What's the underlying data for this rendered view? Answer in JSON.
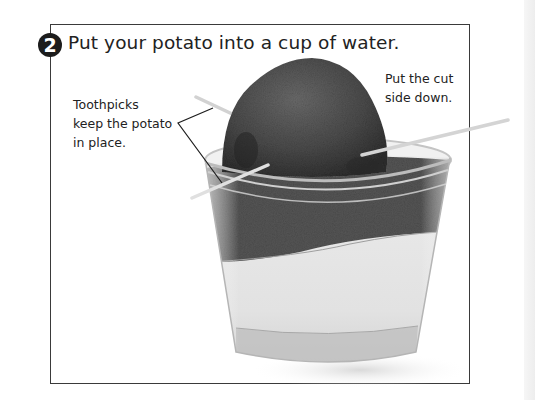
{
  "step": {
    "number": "2",
    "title": "Put your potato into a cup of water."
  },
  "callouts": {
    "toothpicks": {
      "lines": [
        "Toothpicks",
        "keep the potato",
        "in place."
      ]
    },
    "cut_side": {
      "lines": [
        "Put the cut",
        "side down."
      ]
    }
  },
  "illustration": {
    "subject": "potato-in-cup-of-water",
    "colors": {
      "potato_dark": "#3c3c3c",
      "potato_mid": "#5a5a5a",
      "water": "#e4e4e4",
      "cup_edge": "#bdbdbd",
      "toothpick": "#d6d6d6",
      "panel_border": "#3a3a3a",
      "badge": "#1c1c1c"
    }
  }
}
